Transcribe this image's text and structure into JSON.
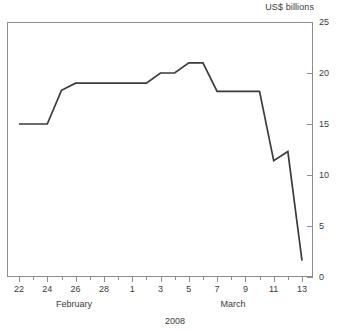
{
  "chart_data": {
    "type": "line",
    "title": "",
    "subtitle": "",
    "xlabel": "2008",
    "ylabel": "US$ billions",
    "ylim": [
      0,
      25
    ],
    "yticks": [
      0,
      5,
      10,
      15,
      20,
      25
    ],
    "grid": false,
    "legend": null,
    "x_tick_labels": [
      "22",
      "24",
      "26",
      "28",
      "1",
      "3",
      "5",
      "7",
      "9",
      "11",
      "13"
    ],
    "x_group_labels": [
      "February",
      "March"
    ],
    "x": [
      "Feb 22",
      "Feb 23",
      "Feb 24",
      "Feb 25",
      "Feb 26",
      "Feb 27",
      "Feb 28",
      "Feb 29",
      "Mar 1",
      "Mar 2",
      "Mar 3",
      "Mar 4",
      "Mar 5",
      "Mar 6",
      "Mar 7",
      "Mar 8",
      "Mar 9",
      "Mar 10",
      "Mar 11",
      "Mar 12",
      "Mar 13"
    ],
    "values": [
      15.0,
      15.0,
      15.0,
      18.3,
      19.0,
      19.0,
      19.0,
      19.0,
      19.0,
      19.0,
      20.0,
      20.0,
      21.0,
      21.0,
      18.2,
      18.2,
      18.2,
      18.2,
      11.4,
      12.3,
      1.6
    ],
    "series": [
      {
        "name": "US$ billions",
        "color": "#3b3b3b",
        "values": [
          15.0,
          15.0,
          15.0,
          18.3,
          19.0,
          19.0,
          19.0,
          19.0,
          19.0,
          19.0,
          20.0,
          20.0,
          21.0,
          21.0,
          18.2,
          18.2,
          18.2,
          18.2,
          11.4,
          12.3,
          1.6
        ]
      }
    ],
    "annotations": []
  },
  "axis": {
    "y_title": "US$ billions",
    "x_title": "2008",
    "y_labels": [
      "25",
      "20",
      "15",
      "10",
      "5",
      "0"
    ],
    "x_labels": [
      "22",
      "24",
      "26",
      "28",
      "1",
      "3",
      "5",
      "7",
      "9",
      "11",
      "13"
    ],
    "months": [
      {
        "label": "February",
        "center_day_index": 3
      },
      {
        "label": "March",
        "center_day_index": 14
      }
    ]
  },
  "style": {
    "line_color": "#3b3b3b",
    "frame_color": "#8d8d8d",
    "text_color": "#3a3a3a",
    "background": "#ffffff"
  },
  "footer": {
    "sliver_text": ""
  }
}
